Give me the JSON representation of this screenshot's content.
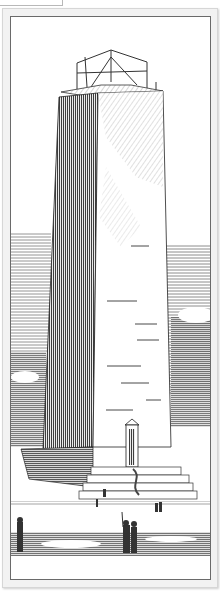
{
  "image": {
    "subject": "engraving of an obelisk monument",
    "style": "black-and-white line engraving",
    "elements": [
      "scaffolding-on-top",
      "obelisk-shaft",
      "doorway-with-pediment",
      "stepped-base",
      "human-figures",
      "clouded-sky",
      "ground"
    ]
  },
  "colors": {
    "ink": "#1e1e1e",
    "paper": "#ffffff",
    "plate_bg": "#f2f2f2",
    "frame_border": "#6a6a6a"
  }
}
